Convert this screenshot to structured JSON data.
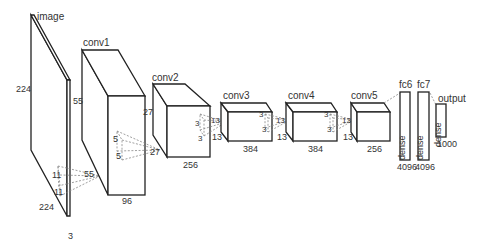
{
  "layers": [
    {
      "id": "image",
      "name": "image",
      "height": "224",
      "width": "224",
      "depth": "3"
    },
    {
      "id": "conv1",
      "name": "conv1",
      "height": "55",
      "width": "55",
      "depth": "96",
      "kernel_in": "11",
      "kernel_in_2": "11"
    },
    {
      "id": "conv2",
      "name": "conv2",
      "height": "27",
      "width": "27",
      "depth": "256",
      "kernel_in": "5",
      "kernel_in_2": "5"
    },
    {
      "id": "conv3",
      "name": "conv3",
      "height": "13",
      "width": "13",
      "depth": "384",
      "kernel_in": "3",
      "kernel_in_2": "3"
    },
    {
      "id": "conv4",
      "name": "conv4",
      "height": "13",
      "width": "13",
      "depth": "384",
      "kernel_in": "3",
      "kernel_in_2": "3"
    },
    {
      "id": "conv5",
      "name": "conv5",
      "height": "13",
      "width": "13",
      "depth": "256",
      "kernel_in": "3",
      "kernel_in_2": "3"
    },
    {
      "id": "fc6",
      "name": "fc6",
      "type_label": "dense",
      "units": "4096"
    },
    {
      "id": "fc7",
      "name": "fc7",
      "type_label": "dense",
      "units": "4096"
    },
    {
      "id": "output",
      "name": "output",
      "type_label": "dense",
      "units": "1000"
    }
  ],
  "colors": {
    "stroke": "#222222",
    "dash": "#888888",
    "text": "#333333",
    "background": "#ffffff"
  }
}
